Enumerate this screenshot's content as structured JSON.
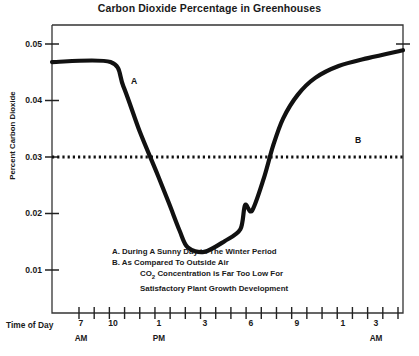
{
  "chart_data": {
    "type": "line",
    "title": "Carbon Dioxide Percentage in Greenhouses",
    "xlabel": "Time of Day",
    "ylabel": "Percent Carbon Dioxide",
    "ylim": [
      0.005,
      0.0535
    ],
    "xlim": [
      6,
      16.5
    ],
    "yticks": [
      0.05,
      0.04,
      0.03,
      0.02,
      0.01
    ],
    "ytick_labels": [
      "0.05",
      "0.04",
      "0.03",
      "0.02",
      "0.01"
    ],
    "xtick_labels": [
      "7",
      "10",
      "1",
      "3",
      "6",
      "9",
      "1",
      "3"
    ],
    "xtick_sublabels": [
      "AM",
      "",
      "PM",
      "",
      "",
      "",
      "",
      "AM"
    ],
    "grid": false,
    "legend_position": "none",
    "series": [
      {
        "name": "A",
        "style": "solid",
        "label": "A",
        "points": [
          [
            0.0,
            0.0468
          ],
          [
            1.0,
            0.0468
          ],
          [
            1.22,
            0.0425
          ],
          [
            1.5,
            0.0345
          ],
          [
            1.78,
            0.0275
          ],
          [
            2.0,
            0.0218
          ],
          [
            2.18,
            0.017
          ],
          [
            2.32,
            0.014
          ],
          [
            2.6,
            0.0132
          ],
          [
            2.95,
            0.0151
          ],
          [
            3.22,
            0.0172
          ],
          [
            3.3,
            0.0215
          ],
          [
            3.42,
            0.0205
          ],
          [
            3.62,
            0.0262
          ],
          [
            3.78,
            0.032
          ],
          [
            3.95,
            0.0368
          ],
          [
            4.2,
            0.041
          ],
          [
            4.5,
            0.044
          ],
          [
            4.9,
            0.0461
          ],
          [
            5.4,
            0.0475
          ],
          [
            6.0,
            0.0489
          ]
        ]
      },
      {
        "name": "B",
        "style": "dotted",
        "label": "B",
        "value": 0.03,
        "points": [
          [
            0.0,
            0.03
          ],
          [
            6.0,
            0.03
          ]
        ]
      }
    ],
    "annotations": [
      {
        "text": "A",
        "x": 135,
        "y": 83
      },
      {
        "text": "B",
        "x": 357,
        "y": 141
      }
    ],
    "notes": [
      "A. During A Sunny Day in The Winter Period",
      "B. As Compared To Outside Air",
      "CO2 Concentration is Far Too Low For",
      "Satisfactory Plant Growth Development"
    ],
    "colors": {
      "line": "#111111",
      "axis": "#333333",
      "background": "#ffffff"
    }
  }
}
